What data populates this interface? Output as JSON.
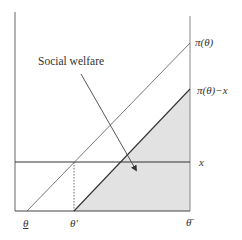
{
  "diagram": {
    "title": "",
    "annotation": "Social welfare",
    "curves": {
      "profit": "π(θ)",
      "profit_minus_x": "π(θ)−x",
      "horizontal": "x"
    },
    "x_ticks": {
      "theta_low": "θ",
      "theta_prime": "θ'",
      "theta_high": "θ̄"
    },
    "colors": {
      "axis": "#555555",
      "line": "#444444",
      "shade": "#e2e2e2",
      "text": "#333333"
    }
  }
}
